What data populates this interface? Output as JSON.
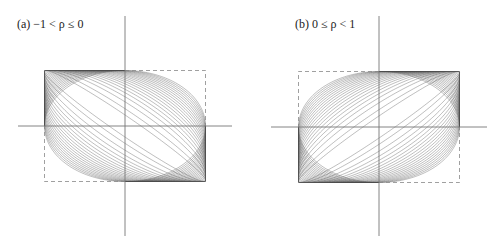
{
  "figure": {
    "panels": [
      {
        "id": "a",
        "label": "(a) −1 < ρ ≤ 0",
        "rho_range": "-1 < rho <= 0",
        "rho_values": [
          0,
          -0.05,
          -0.1,
          -0.15,
          -0.2,
          -0.25,
          -0.3,
          -0.35,
          -0.4,
          -0.45,
          -0.5,
          -0.55,
          -0.6,
          -0.65,
          -0.7,
          -0.75,
          -0.8,
          -0.85,
          -0.9,
          -0.95,
          -0.98
        ],
        "origin": [
          125,
          126
        ],
        "half_width": 80.5,
        "half_height": 55.5,
        "x_axis": [
          18,
          232
        ],
        "y_axis": [
          16,
          236
        ],
        "label_pos": [
          17,
          17
        ],
        "dashed_corners": [
          "top-right",
          "bottom-left"
        ]
      },
      {
        "id": "b",
        "label": "(b) 0 ≤ ρ < 1",
        "rho_range": "0 <= rho < 1",
        "rho_values": [
          0,
          0.05,
          0.1,
          0.15,
          0.2,
          0.25,
          0.3,
          0.35,
          0.4,
          0.45,
          0.5,
          0.55,
          0.6,
          0.65,
          0.7,
          0.75,
          0.8,
          0.85,
          0.9,
          0.95,
          0.98
        ],
        "origin": [
          379,
          127
        ],
        "half_width": 80.5,
        "half_height": 55.5,
        "x_axis": [
          271,
          487
        ],
        "y_axis": [
          16,
          236
        ],
        "label_pos": [
          295,
          17
        ],
        "dashed_corners": [
          "top-left",
          "bottom-right"
        ]
      }
    ],
    "colors": {
      "axis": "#777777",
      "ellipse": "#555555",
      "box_solid": "#444444",
      "box_dashed": "#888888",
      "text": "#222222"
    }
  }
}
